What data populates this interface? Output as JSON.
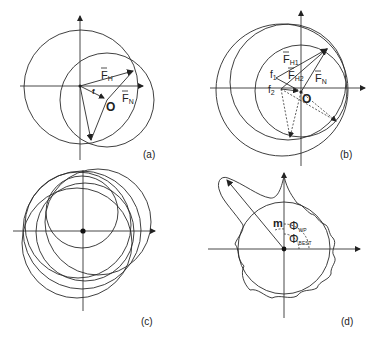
{
  "figure": {
    "panels": [
      {
        "id": "a",
        "label": "(a)",
        "vectors": {
          "fh": "F",
          "fh_sub": "H",
          "fn": "F",
          "fn_sub": "N",
          "f": "f",
          "origin": "O"
        }
      },
      {
        "id": "b",
        "label": "(b)",
        "vectors": {
          "fh1": "F",
          "fh1_sub": "H1",
          "fh2": "F",
          "fh2_sub": "H2",
          "fn": "F",
          "fn_sub": "N",
          "f1": "f",
          "f1_sub": "1",
          "f2": "f",
          "f2_sub": "2",
          "origin": "O"
        }
      },
      {
        "id": "c",
        "label": "(c)"
      },
      {
        "id": "d",
        "label": "(d)",
        "symbols": {
          "m": "m",
          "phi_wp": "Φ",
          "phi_wp_sub": "WP",
          "phi_best": "Φ",
          "phi_best_sub": "BEST"
        }
      }
    ]
  }
}
